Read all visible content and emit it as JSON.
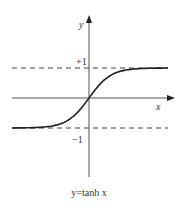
{
  "chart_data": {
    "type": "line",
    "title": "y=tanh x",
    "xlabel": "x",
    "ylabel": "y",
    "series": [
      {
        "name": "tanh x",
        "function": "tanh",
        "x": [
          -3,
          -2,
          -1,
          0,
          1,
          2,
          3
        ],
        "values": [
          -0.995,
          -0.964,
          -0.762,
          0,
          0.762,
          0.964,
          0.995
        ]
      }
    ],
    "asymptotes": [
      {
        "y": 1,
        "label": "+1",
        "style": "dashed"
      },
      {
        "y": -1,
        "label": "−1",
        "style": "dashed"
      }
    ],
    "ylim": [
      -1,
      1
    ],
    "grid": false
  },
  "labels": {
    "y_axis": "y",
    "x_axis": "x",
    "plus_one": "+1",
    "minus_one": "−1",
    "caption": "y=tanh x"
  }
}
